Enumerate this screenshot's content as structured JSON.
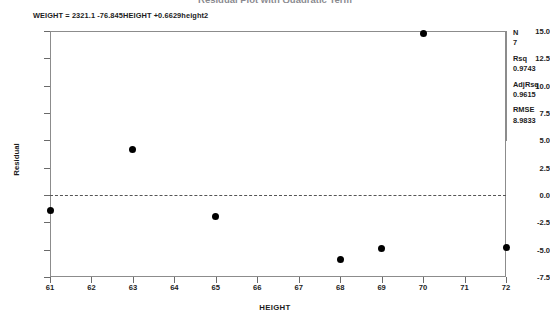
{
  "chart_data": {
    "type": "scatter",
    "title": "Residual Plot with Quadratic Term",
    "equation": "WEIGHT = 2321.1 -76.845HEIGHT +0.6629height2",
    "xlabel": "HEIGHT",
    "ylabel": "Residual",
    "xlim": [
      61,
      72
    ],
    "ylim": [
      -7.5,
      15.0
    ],
    "xticks": [
      61,
      62,
      63,
      64,
      65,
      66,
      67,
      68,
      69,
      70,
      71,
      72
    ],
    "xtick_labels": [
      "61",
      "62",
      "63",
      "64",
      "65",
      "66",
      "67",
      "68",
      "69",
      "70",
      "71",
      "72"
    ],
    "yticks": [
      15.0,
      12.5,
      10.0,
      7.5,
      5.0,
      2.5,
      0.0,
      -2.5,
      -5.0,
      -7.5
    ],
    "ytick_labels": [
      "15.0",
      "12.5",
      "10.0",
      "7.5",
      "5.0",
      "2.5",
      "0.0",
      "-2.5",
      "-5.0",
      "-7.5"
    ],
    "grid": false,
    "reference_line": 0.0,
    "marker_color": "#000000",
    "points": [
      {
        "x": 61,
        "y": -1.4
      },
      {
        "x": 63,
        "y": 4.2
      },
      {
        "x": 65,
        "y": -2.0
      },
      {
        "x": 68,
        "y": -5.9
      },
      {
        "x": 69,
        "y": -4.9
      },
      {
        "x": 70,
        "y": 14.8
      },
      {
        "x": 72,
        "y": -4.8
      }
    ]
  },
  "stats": [
    {
      "name": "N",
      "value": "7"
    },
    {
      "name": "Rsq",
      "value": "0.9743"
    },
    {
      "name": "AdjRsq",
      "value": "0.9615"
    },
    {
      "name": "RMSE",
      "value": "8.9833"
    }
  ]
}
